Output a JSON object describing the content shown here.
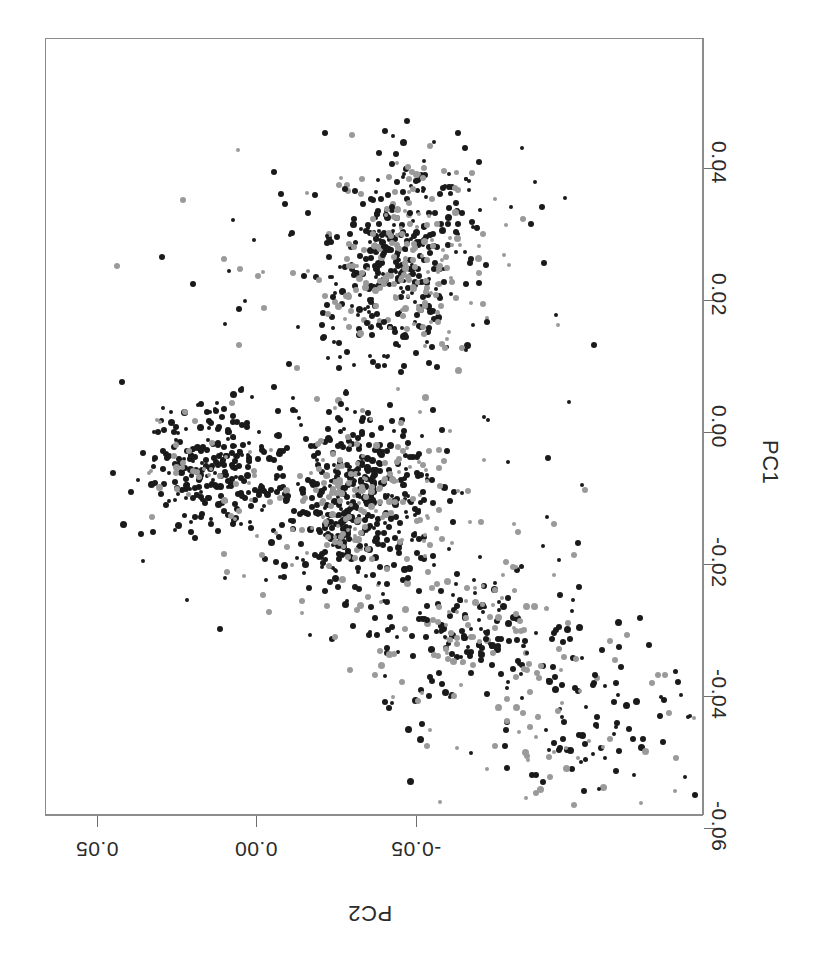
{
  "figure": {
    "background_color": "#ffffff",
    "frame_color": "#8c8c8c",
    "orientation_note": "rotated"
  },
  "axes": {
    "right": {
      "title": "PC1",
      "tick_labels": [
        "0.04",
        "0.02",
        "0.00",
        "-0.02",
        "-0.04",
        "-0.06"
      ],
      "tick_values": [
        0.04,
        0.02,
        0.0,
        -0.02,
        -0.04,
        -0.06
      ],
      "tick_pixel_y": [
        130,
        262,
        394,
        526,
        658,
        790
      ]
    },
    "bottom": {
      "title": "PC2",
      "tick_labels": [
        "0.05",
        "0.00",
        "-0.05"
      ],
      "tick_values": [
        0.05,
        0.0,
        -0.05
      ],
      "tick_pixel_x": [
        52,
        211,
        371
      ]
    }
  },
  "chart_data": {
    "type": "scatter",
    "title": "",
    "xlabel": "PC2",
    "ylabel": "PC1",
    "xlim": [
      0.072,
      -0.062
    ],
    "ylim": [
      0.052,
      -0.068
    ],
    "grid": false,
    "legend": "none",
    "marker": {
      "shape": "circle",
      "size_px": 6
    },
    "series": [
      {
        "name": "group-dark",
        "color": "#1a1a1a",
        "count": 1120,
        "description": "dark filled circles forming main elongated cluster plus left wing"
      },
      {
        "name": "group-gray",
        "color": "#9a9a9a",
        "count": 480,
        "description": "light gray filled circles overlapping the upper and central clusters"
      }
    ],
    "clusters": [
      {
        "name": "upper-cluster",
        "center_px": [
          358,
          215
        ],
        "spread_px": [
          78,
          95
        ],
        "n_dark": 300,
        "n_gray": 180
      },
      {
        "name": "central-cluster",
        "center_px": [
          312,
          470
        ],
        "spread_px": [
          70,
          88
        ],
        "n_dark": 400,
        "n_gray": 150
      },
      {
        "name": "left-wing",
        "center_px": [
          168,
          432
        ],
        "spread_px": [
          72,
          62
        ],
        "n_dark": 240,
        "n_gray": 35
      },
      {
        "name": "lower-tail",
        "center_px": [
          430,
          600
        ],
        "spread_px": [
          95,
          75
        ],
        "n_dark": 110,
        "n_gray": 70
      },
      {
        "name": "sparse-outliers",
        "center_px": [
          520,
          690
        ],
        "spread_px": [
          130,
          95
        ],
        "n_dark": 70,
        "n_gray": 45
      }
    ]
  }
}
